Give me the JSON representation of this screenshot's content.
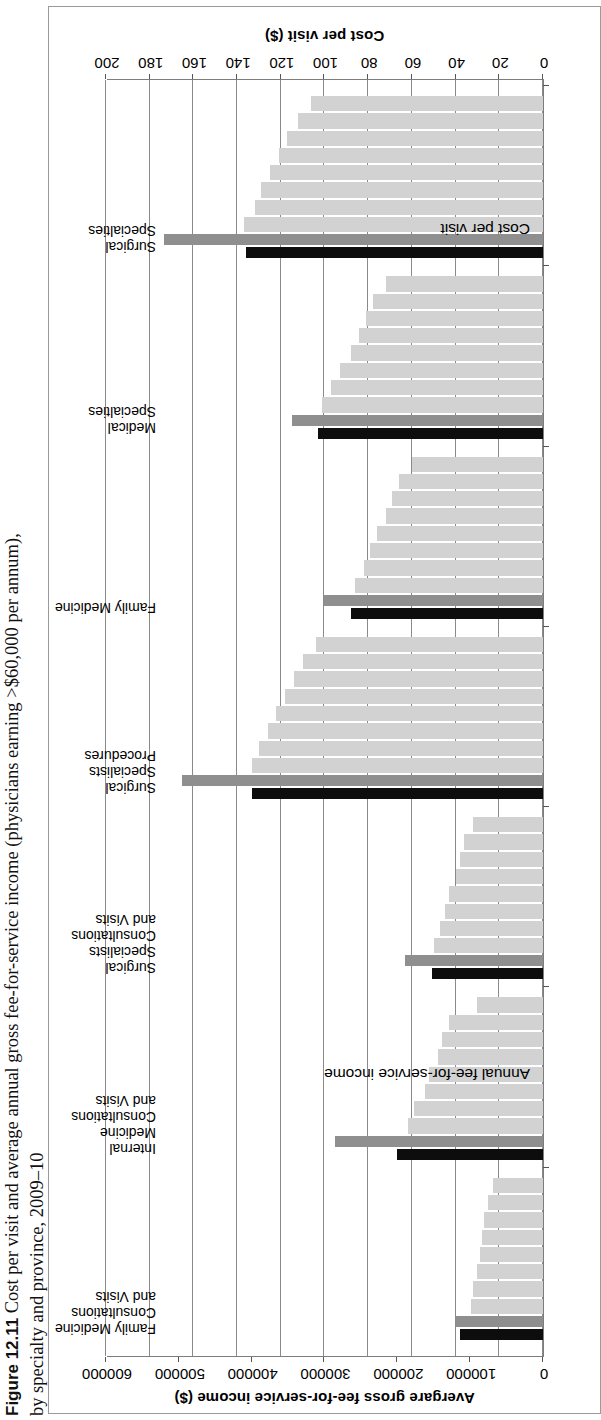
{
  "caption": {
    "figure_number": "Figure 12.11",
    "line1": "Cost per visit and average annual gross fee-for-service income (physicians earning >$60,000 per annum),",
    "line2": "by specialty and province, 2009–10"
  },
  "chart_data": {
    "type": "bar",
    "orientation": "horizontal",
    "title": "",
    "xlabel": "Cost per visit ($)",
    "x2label": "Avergare gross fee-for-service income ($)",
    "ylabel": "",
    "grid": true,
    "legend_position": "in-plot annotations",
    "annotations": [
      "Cost per visit",
      "Annual fee-for-service income"
    ],
    "xlim": [
      0,
      200
    ],
    "xticks": [
      0,
      20,
      40,
      60,
      80,
      100,
      120,
      140,
      160,
      180,
      200
    ],
    "x2lim": [
      0,
      600000
    ],
    "x2ticks": [
      0,
      100000,
      200000,
      300000,
      400000,
      500000,
      600000
    ],
    "categories": [
      "Family Medicine Consultations and Visits",
      "Internal Medicine Consultations and Visits",
      "Surgical Specialists Consultations and Visits",
      "Surgical Specialists Procedures",
      "Family Medicine",
      "Medical Specialties",
      "Surgical Specialties"
    ],
    "series": [
      {
        "name": "Cost per visit",
        "color": "#0d0d0d",
        "axis": "cost",
        "unit": "$",
        "values": [
          38,
          67,
          51,
          133,
          88,
          103,
          136
        ]
      },
      {
        "name": "Annual fee-for-service income",
        "color": "#8f8f8f",
        "axis": "income",
        "unit": "$",
        "values": [
          120000,
          285000,
          190000,
          495000,
          300000,
          345000,
          520000
        ]
      },
      {
        "name": "Province cost per visit",
        "color": "#d2d2d2",
        "axis": "cost",
        "unit": "$",
        "province_values": [
          [
            33,
            32,
            30,
            29,
            28,
            27,
            25,
            23
          ],
          [
            62,
            59,
            54,
            52,
            48,
            46,
            43,
            30
          ],
          [
            50,
            47,
            45,
            43,
            40,
            38,
            36,
            32
          ],
          [
            133,
            130,
            126,
            122,
            118,
            114,
            110,
            104
          ],
          [
            86,
            82,
            79,
            76,
            72,
            69,
            66,
            60
          ],
          [
            101,
            97,
            93,
            88,
            84,
            81,
            78,
            72
          ],
          [
            137,
            132,
            129,
            125,
            121,
            117,
            112,
            106
          ]
        ]
      }
    ]
  },
  "axes": {
    "cost_ticks": [
      "0",
      "20",
      "40",
      "60",
      "80",
      "100",
      "120",
      "140",
      "160",
      "180",
      "200"
    ],
    "income_ticks": [
      "0",
      "100000",
      "200000",
      "300000",
      "400000",
      "500000",
      "600000"
    ],
    "cost_title": "Cost per visit ($)",
    "income_title": "Avergare gross fee-for-service income ($)"
  },
  "annotations": {
    "cost": "Cost per visit",
    "income": "Annual fee-for-service income"
  },
  "category_labels": [
    "Family Medicine\nConsultations\nand Visits",
    "Internal\nMedicine\nConsultations\nand Visits",
    "Surgical\nSpecialists\nConsultations\nand Visits",
    "Surgical\nSpecialists\nProcedures",
    "Family Medicine",
    "Medical\nSpecialties",
    "Surgical\nSpecialties"
  ]
}
